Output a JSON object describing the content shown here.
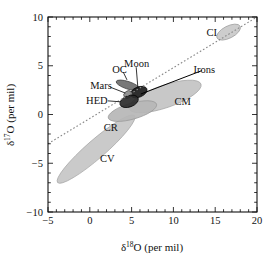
{
  "chart_data": {
    "type": "scatter",
    "title": "",
    "xlabel": "δ¹⁸O (per mil)",
    "ylabel": "δ¹⁷O (per mil)",
    "xlabel_parts": {
      "delta": "δ",
      "sup": "18",
      "rest": "O (per mil)"
    },
    "ylabel_parts": {
      "delta": "δ",
      "sup": "17",
      "rest": "O (per mil)"
    },
    "xlim": [
      -5,
      20
    ],
    "ylim": [
      -10,
      10
    ],
    "xticks": [
      -5,
      0,
      5,
      10,
      15,
      20
    ],
    "yticks": [
      -10,
      -5,
      0,
      5,
      10
    ],
    "xtick_labels": [
      "−5",
      "0",
      "5",
      "10",
      "15",
      "20"
    ],
    "ytick_labels": [
      "−10",
      "−5",
      "0",
      "5",
      "10"
    ],
    "x_minor_interval": 1,
    "y_minor_interval": 1,
    "grid": false,
    "legend": "none",
    "frame": "box-all-sides-inward-ticks",
    "reference_lines": [
      {
        "name": "terrestrial-fractionation-line",
        "style": "dotted",
        "color": "#8a8a8a",
        "x1": -5.0,
        "y1": -3.0,
        "x2": 20.0,
        "y2": 10.0
      },
      {
        "name": "irons-leader-line",
        "style": "solid",
        "color": "#000000",
        "x1": 6.1,
        "y1": 2.1,
        "x2": 13.4,
        "y2": 4.5
      }
    ],
    "groups": [
      {
        "label": "CI",
        "cx": 16.6,
        "cy": 8.45,
        "rx": 1.55,
        "ry": 0.62,
        "angle_deg": -27,
        "fill": "#c9c9c9",
        "stroke": "#9a9a9a",
        "label_x": 14.6,
        "label_y": 8.45,
        "leader": false
      },
      {
        "label": "CM",
        "cx": 9.0,
        "cy": 1.85,
        "rx": 4.55,
        "ry": 1.15,
        "angle_deg": -19,
        "fill": "#c3c3c3",
        "stroke": "#a3a3a3",
        "label_x": 11.1,
        "label_y": 1.35,
        "leader": false
      },
      {
        "label": "CV",
        "cx": 0.75,
        "cy": -3.55,
        "rx": 6.1,
        "ry": 0.95,
        "angle_deg": -41,
        "fill": "#c6c6c6",
        "stroke": "#a6a6a6",
        "label_x": 2.1,
        "label_y": -4.5,
        "leader": false
      },
      {
        "label": "CR",
        "cx": 5.1,
        "cy": 0.35,
        "rx": 3.0,
        "ry": 0.82,
        "angle_deg": -16,
        "fill": "#b6b6b6",
        "stroke": "#989898",
        "label_x": 2.5,
        "label_y": -1.35,
        "leader": false
      },
      {
        "label": "OC",
        "cx": 4.55,
        "cy": 3.0,
        "rx": 0.45,
        "ry": 1.25,
        "angle_deg": -72,
        "fill": "#6d6d6d",
        "stroke": "#3a3a3a",
        "label_x": 3.55,
        "label_y": 4.65,
        "leader": true,
        "leader_x1": 4.0,
        "leader_y1": 4.35,
        "leader_x2": 4.45,
        "leader_y2": 3.55
      },
      {
        "label": "Moon",
        "cx": 5.85,
        "cy": 2.3,
        "rx": 1.05,
        "ry": 0.52,
        "angle_deg": -22,
        "fill": "#1c1c1c",
        "stroke": "#000000",
        "label_x": 5.6,
        "label_y": 5.25,
        "leader": true,
        "leader_x1": 5.55,
        "leader_y1": 4.85,
        "leader_x2": 5.75,
        "leader_y2": 2.75
      },
      {
        "label": "Mars",
        "cx": 4.55,
        "cy": 2.05,
        "rx": 0.52,
        "ry": 0.36,
        "angle_deg": -38,
        "fill": "#8a8a8a",
        "stroke": "#4a4a4a",
        "label_x": 1.35,
        "label_y": 3.0,
        "leader": true,
        "leader_x1": 2.45,
        "leader_y1": 2.8,
        "leader_x2": 4.25,
        "leader_y2": 2.2
      },
      {
        "label": "HED",
        "cx": 4.7,
        "cy": 1.35,
        "rx": 1.15,
        "ry": 0.58,
        "angle_deg": -20,
        "fill": "#2a2a2a",
        "stroke": "#000000",
        "label_x": 0.85,
        "label_y": 1.45,
        "leader": true,
        "leader_x1": 2.15,
        "leader_y1": 1.4,
        "leader_x2": 3.7,
        "leader_y2": 1.3
      },
      {
        "label": "Irons",
        "cx": null,
        "cy": null,
        "rx": null,
        "ry": null,
        "angle_deg": 0,
        "fill": "none",
        "stroke": "none",
        "label_x": 13.7,
        "label_y": 4.6,
        "leader": false
      }
    ]
  },
  "colors": {
    "background": "#ffffff",
    "axis": "#111111",
    "text": "#111111",
    "tfl_line": "#8a8a8a",
    "fill_light": "#c6c6c6",
    "fill_dark": "#1c1c1c"
  }
}
